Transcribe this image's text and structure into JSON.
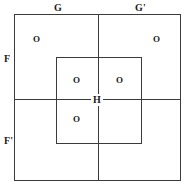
{
  "diagram": {
    "colors": {
      "stroke": "#3b3b3b",
      "text": "#1a1a1a",
      "background": "#ffffff"
    },
    "axis_labels": {
      "top_left": "G",
      "top_right": "G'",
      "left_upper": "F",
      "left_lower": "F'"
    },
    "center_label": "H",
    "region_labels": {
      "outer_top_left": "O",
      "outer_top_right": "O",
      "inner_top_left": "O",
      "inner_top_right": "O",
      "inner_bottom_left": "O"
    }
  }
}
